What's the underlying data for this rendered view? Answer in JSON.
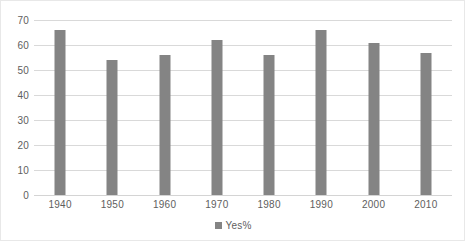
{
  "chart_data": {
    "type": "bar",
    "title": "",
    "subtitle": "",
    "xlabel": "",
    "ylabel": "",
    "categories": [
      "1940",
      "1950",
      "1960",
      "1970",
      "1980",
      "1990",
      "2000",
      "2010"
    ],
    "series": [
      {
        "name": "Yes%",
        "values": [
          66,
          54,
          56,
          62,
          56,
          66,
          61,
          57
        ],
        "color": "#848484"
      }
    ],
    "ylim": [
      0,
      70
    ],
    "y_ticks": [
      0,
      10,
      20,
      30,
      40,
      50,
      60,
      70
    ],
    "y_tick_labels": [
      "0",
      "10",
      "20",
      "30",
      "40",
      "50",
      "60",
      "70"
    ],
    "grid": true,
    "grid_axis": "y",
    "legend": {
      "position": "bottom",
      "entries": [
        {
          "label": "Yes%",
          "marker": "square",
          "color": "#848484"
        }
      ]
    },
    "annotations": []
  },
  "colors": {
    "bar": "#848484",
    "gridline": "#d9d9d9",
    "axis_text": "#5e5e5e",
    "background": "#ffffff",
    "border": "#e8e8e8"
  }
}
